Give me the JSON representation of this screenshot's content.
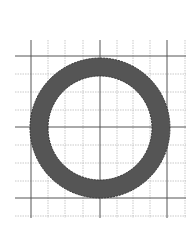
{
  "figure": {
    "colors": {
      "background": "#ffffff",
      "ring_fill": "#555555",
      "ring_edge": "#333333",
      "major_grid": "#555555",
      "minor_grid": "#bbbbbb"
    },
    "grid": {
      "major_x": [
        31,
        100,
        167
      ],
      "minor_x": [
        48,
        65,
        83,
        117,
        133,
        150,
        185
      ],
      "major_y": [
        56,
        127,
        198
      ],
      "minor_y": [
        74,
        92,
        110,
        145,
        163,
        181,
        216
      ],
      "x_range": [
        15,
        186
      ],
      "y_range": [
        40,
        218
      ]
    },
    "ring": {
      "center_x": 100,
      "center_y": 128,
      "outer_radius": 70,
      "inner_radius": 52
    }
  }
}
